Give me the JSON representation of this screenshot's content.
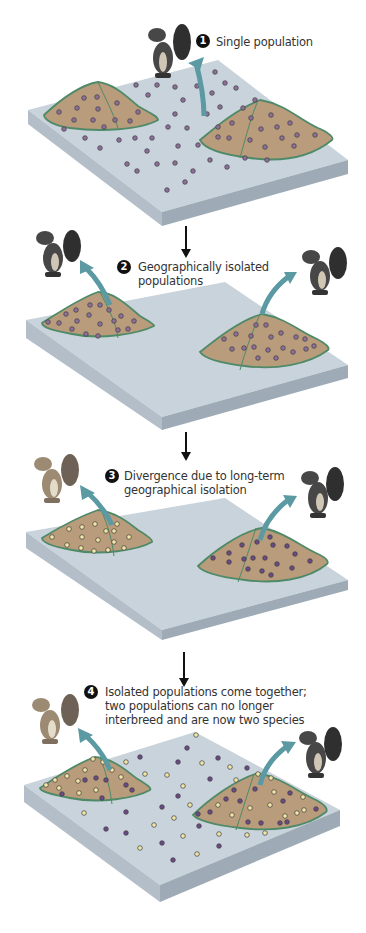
{
  "colors": {
    "platform_top": "#c9d3db",
    "platform_side_left": "#b6c1ca",
    "platform_side_front": "#a5b1bb",
    "mountain": "#b79a7a",
    "mountain_border": "#4f8a68",
    "arrow": "#5b9aa3",
    "dot_ancestral": "#8e6f9a",
    "dot_purple": "#6b4a86",
    "dot_yellow": "#f2e6a6",
    "squirrel_gray": "#4a4a4a",
    "squirrel_tan": "#9c8a73"
  },
  "steps": [
    {
      "number": "1",
      "label": "Single population"
    },
    {
      "number": "2",
      "label_line1": "Geographically isolated",
      "label_line2": "populations"
    },
    {
      "number": "3",
      "label_line1": "Divergence due to long-term",
      "label_line2": "geographical isolation"
    },
    {
      "number": "4",
      "label_line1": "Isolated populations come together;",
      "label_line2": "two populations can no longer",
      "label_line3": "interbreed and are now two species"
    }
  ]
}
